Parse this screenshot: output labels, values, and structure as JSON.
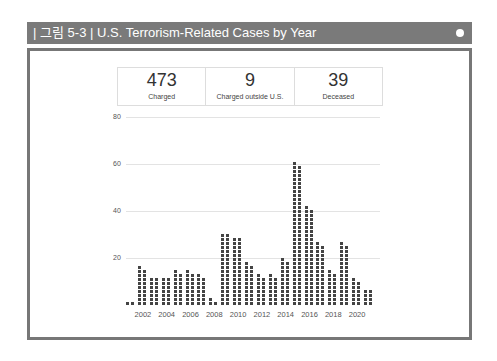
{
  "figure": {
    "label": "| 그림 5-3 |",
    "title": "U.S. Terrorism-Related Cases by Year"
  },
  "stats": [
    {
      "value": "473",
      "label": "Charged"
    },
    {
      "value": "9",
      "label": "Charged outside U.S."
    },
    {
      "value": "39",
      "label": "Deceased"
    }
  ],
  "chart_data": {
    "type": "bar",
    "title": "U.S. Terrorism-Related Cases by Year",
    "xlabel": "",
    "ylabel": "",
    "ylim": [
      0,
      80
    ],
    "yticks": [
      20,
      40,
      60,
      80
    ],
    "xticks": [
      "2002",
      "2004",
      "2006",
      "2008",
      "2010",
      "2012",
      "2014",
      "2016",
      "2018",
      "2020"
    ],
    "grid": true,
    "categories": [
      "2001",
      "2002",
      "2003",
      "2004",
      "2005",
      "2006",
      "2007",
      "2008",
      "2009",
      "2010",
      "2011",
      "2012",
      "2013",
      "2014",
      "2015",
      "2016",
      "2017",
      "2018",
      "2019",
      "2020",
      "2021"
    ],
    "values": [
      2,
      19,
      14,
      14,
      17,
      17,
      15,
      3,
      36,
      34,
      21,
      15,
      15,
      23,
      71,
      49,
      31,
      17,
      31,
      13,
      8
    ],
    "style": "unit dot (waffle) columns, 2 dots per row"
  }
}
